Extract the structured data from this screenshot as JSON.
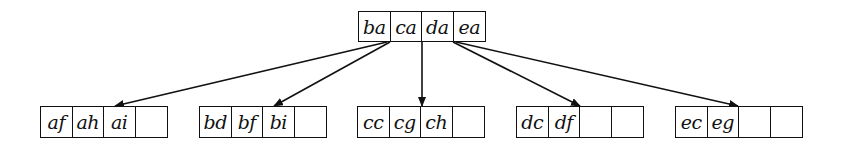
{
  "diagram": {
    "type": "b-tree",
    "root": {
      "keys": [
        "ba",
        "ca",
        "da",
        "ea"
      ],
      "box": {
        "x": 358,
        "y": 11,
        "w": 128,
        "h": 31
      }
    },
    "leaves": [
      {
        "keys": [
          "af",
          "ah",
          "ai",
          ""
        ],
        "box": {
          "x": 40,
          "y": 106,
          "w": 128,
          "h": 32
        }
      },
      {
        "keys": [
          "bd",
          "bf",
          "bi",
          ""
        ],
        "box": {
          "x": 199,
          "y": 106,
          "w": 128,
          "h": 32
        }
      },
      {
        "keys": [
          "cc",
          "cg",
          "ch",
          ""
        ],
        "box": {
          "x": 357,
          "y": 106,
          "w": 128,
          "h": 32
        }
      },
      {
        "keys": [
          "dc",
          "df",
          "",
          ""
        ],
        "box": {
          "x": 516,
          "y": 106,
          "w": 128,
          "h": 32
        }
      },
      {
        "keys": [
          "ec",
          "eg",
          "",
          ""
        ],
        "box": {
          "x": 675,
          "y": 106,
          "w": 128,
          "h": 32
        }
      }
    ],
    "edges": [
      {
        "from": "root",
        "to": "leaf-0",
        "x1": 387,
        "y1": 42,
        "x2": 115,
        "y2": 106
      },
      {
        "from": "root",
        "to": "leaf-1",
        "x1": 390,
        "y1": 42,
        "x2": 274,
        "y2": 106
      },
      {
        "from": "root",
        "to": "leaf-2",
        "x1": 422,
        "y1": 42,
        "x2": 422,
        "y2": 106
      },
      {
        "from": "root",
        "to": "leaf-3",
        "x1": 453,
        "y1": 42,
        "x2": 580,
        "y2": 106
      },
      {
        "from": "root",
        "to": "leaf-4",
        "x1": 456,
        "y1": 42,
        "x2": 738,
        "y2": 106
      }
    ],
    "colors": {
      "stroke": "#111111",
      "background": "#ffffff"
    }
  }
}
